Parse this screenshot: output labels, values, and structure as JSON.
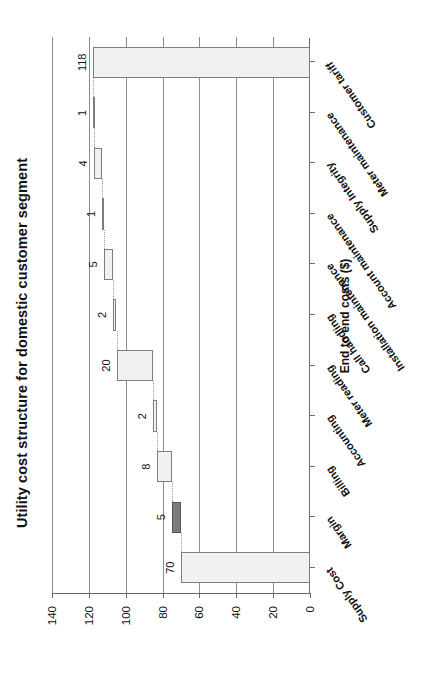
{
  "chart_data": {
    "type": "bar",
    "chart_subtype": "waterfall",
    "title": "Utility cost structure for domestic customer segment",
    "xlabel": "",
    "ylabel": "End to end costs ($)",
    "ylim": [
      0,
      140
    ],
    "yticks": [
      0,
      20,
      40,
      60,
      80,
      100,
      120,
      140
    ],
    "ytick_labels": [
      "0",
      "20",
      "40",
      "60",
      "80",
      "100",
      "120",
      "140"
    ],
    "grid": true,
    "grid_axis": "y",
    "legend": false,
    "orientation": "vertical",
    "categories": [
      "Supply Cost",
      "Margin",
      "Billing",
      "Accounting",
      "Meter reading",
      "Call handling",
      "Installation maintenance",
      "Account maintenance",
      "Supply Integrity",
      "Meter maintenance",
      "Customer tariff"
    ],
    "values": [
      70,
      5,
      8,
      2,
      20,
      2,
      5,
      1,
      4,
      1,
      118
    ],
    "data_labels": [
      "70",
      "5",
      "8",
      "2",
      "20",
      "2",
      "5",
      "1",
      "4",
      "1",
      "118"
    ],
    "bar_kinds": [
      "total",
      "delta",
      "delta",
      "delta",
      "delta",
      "delta",
      "delta",
      "delta",
      "delta",
      "delta",
      "total"
    ],
    "cumulative_start": [
      0,
      70,
      75,
      83,
      85,
      105,
      107,
      112,
      113,
      117,
      0
    ],
    "cumulative_end": [
      70,
      75,
      83,
      85,
      105,
      107,
      112,
      113,
      117,
      118,
      118
    ],
    "colors": {
      "total_bar": "#f1f1f1",
      "delta_bar": "#f1f1f1",
      "margin_bar": "#7c7c7c",
      "bar_border": "#7d7d7d",
      "gridline": "#8c8c8c",
      "axis": "#6b6b6b",
      "text": "#111111",
      "connector": "#9a9a9a",
      "background": "#ffffff"
    }
  }
}
